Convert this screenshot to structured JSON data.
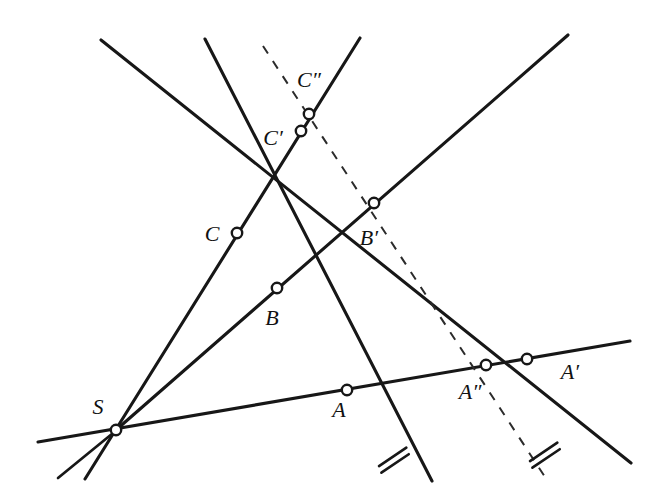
{
  "figure": {
    "kind": "geometry-diagram",
    "width": 661,
    "height": 504,
    "background_color": "#ffffff",
    "line_color": "#171717",
    "dashed_color": "#2b2b2b",
    "node_fill": "#ffffff"
  },
  "points": [
    {
      "id": "S",
      "label": "S",
      "x": 116,
      "y": 430,
      "label_x": 98,
      "label_y": 409,
      "marker": "open-circle"
    },
    {
      "id": "A",
      "label": "A",
      "x": 347,
      "y": 390,
      "label_x": 339,
      "label_y": 412,
      "marker": "open-circle"
    },
    {
      "id": "B",
      "label": "B",
      "x": 277,
      "y": 288,
      "label_x": 272,
      "label_y": 320,
      "marker": "open-circle"
    },
    {
      "id": "C",
      "label": "C",
      "x": 237,
      "y": 233,
      "label_x": 212,
      "label_y": 236,
      "marker": "open-circle"
    },
    {
      "id": "Ap",
      "label": "A′",
      "x": 527,
      "y": 359,
      "label_x": 570,
      "label_y": 374,
      "marker": "open-circle"
    },
    {
      "id": "Bp",
      "label": "B′",
      "x": 374,
      "y": 203,
      "label_x": 369,
      "label_y": 240,
      "marker": "open-circle"
    },
    {
      "id": "Cp",
      "label": "C′",
      "x": 301,
      "y": 131,
      "label_x": 273,
      "label_y": 140,
      "marker": "open-circle"
    },
    {
      "id": "App",
      "label": "A″",
      "x": 486,
      "y": 365,
      "label_x": 470,
      "label_y": 394,
      "marker": "open-circle"
    },
    {
      "id": "Cpp",
      "label": "C″",
      "x": 309,
      "y": 114,
      "label_x": 309,
      "label_y": 82,
      "marker": "open-circle"
    }
  ],
  "segments": [
    {
      "id": "line-S-A-Ap",
      "name": "ray-through-S-A-A-prime",
      "style": "solid",
      "x1": 38,
      "y1": 442,
      "x2": 630,
      "y2": 341
    },
    {
      "id": "line-S-B-Bp",
      "name": "ray-through-S-B-B-prime",
      "style": "solid",
      "x1": 116,
      "y1": 430,
      "x2": 568,
      "y2": 35
    },
    {
      "id": "line-S-C-Cp",
      "name": "ray-through-S-C-C-prime",
      "style": "solid",
      "x1": 85,
      "y1": 479,
      "x2": 360,
      "y2": 38
    },
    {
      "id": "line-C-B-A",
      "name": "side-line-C-B-A-extended",
      "style": "solid",
      "x1": 205,
      "y1": 39,
      "x2": 432,
      "y2": 481
    },
    {
      "id": "line-Cp-Bp-Ap",
      "name": "side-line-C-prime-B-prime-A-prime-extended",
      "style": "solid",
      "x1": 101,
      "y1": 40,
      "x2": 631,
      "y2": 463
    },
    {
      "id": "line-S-down-left",
      "name": "ray-from-S-lower-left",
      "style": "solid",
      "x1": 116,
      "y1": 430,
      "x2": 58,
      "y2": 478
    },
    {
      "id": "dashed-Cpp-App",
      "name": "dashed-line-C-double-prime-to-A-double-prime",
      "style": "dashed",
      "x1": 263,
      "y1": 46,
      "x2": 545,
      "y2": 477
    }
  ],
  "tick_marks": [
    {
      "id": "tick-on-CBA",
      "name": "congruence-tick-double-on-line-CBA",
      "x": 392,
      "y": 455,
      "count": 2,
      "angle_deg": -20
    },
    {
      "id": "tick-on-dash",
      "name": "congruence-tick-double-on-dashed-line",
      "x": 543,
      "y": 450,
      "count": 2,
      "angle_deg": -20
    }
  ],
  "legend": {
    "tick_meaning": "equal segment marks"
  }
}
